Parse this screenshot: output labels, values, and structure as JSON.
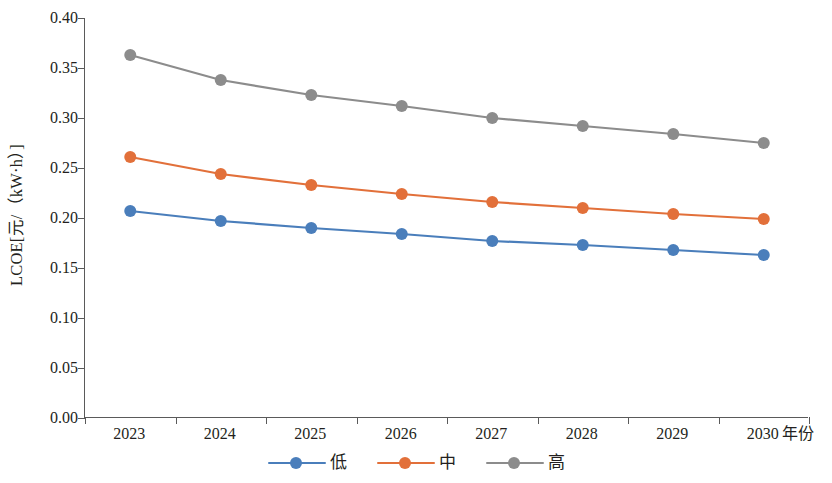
{
  "chart_data": {
    "type": "line",
    "title": "",
    "xlabel": "年份",
    "ylabel": "LCOE[元/（kW·h）]",
    "categories": [
      "2023",
      "2024",
      "2025",
      "2026",
      "2027",
      "2028",
      "2029",
      "2030"
    ],
    "ylim": [
      0.0,
      0.4
    ],
    "ytick_labels": [
      "0.40",
      "0.35",
      "0.30",
      "0.25",
      "0.20",
      "0.15",
      "0.10",
      "0.05",
      "0.00"
    ],
    "ytick_values": [
      0.4,
      0.35,
      0.3,
      0.25,
      0.2,
      0.15,
      0.1,
      0.05,
      0.0
    ],
    "grid": false,
    "legend_position": "bottom-center",
    "series": [
      {
        "name": "低",
        "color": "#4a7ebb",
        "values": [
          0.207,
          0.197,
          0.19,
          0.184,
          0.177,
          0.173,
          0.168,
          0.163
        ]
      },
      {
        "name": "中",
        "color": "#e2703a",
        "values": [
          0.261,
          0.244,
          0.233,
          0.224,
          0.216,
          0.21,
          0.204,
          0.199
        ]
      },
      {
        "name": "高",
        "color": "#8c8c8c",
        "values": [
          0.363,
          0.338,
          0.323,
          0.312,
          0.3,
          0.292,
          0.284,
          0.275
        ]
      }
    ]
  },
  "axes": {
    "axis_color": "#5a5a5a"
  }
}
